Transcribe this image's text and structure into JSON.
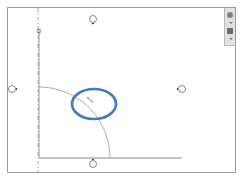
{
  "view": {
    "type": "drawing-canvas",
    "background": "#ffffff",
    "frame_color": "#9a9a9a"
  },
  "navigation_bar": {
    "buttons": [
      {
        "name": "steering-wheel",
        "icon": "steering-wheel-icon"
      },
      {
        "name": "zoom",
        "icon": "zoom-icon"
      }
    ]
  },
  "drawing": {
    "elevation_markers": [
      {
        "position": "top",
        "x": 93,
        "y": 19
      },
      {
        "position": "left",
        "x": 12,
        "y": 89
      },
      {
        "position": "right",
        "x": 182,
        "y": 89
      },
      {
        "position": "bottom",
        "x": 93,
        "y": 163
      }
    ],
    "door_swing_arc": {
      "center_x": 38,
      "center_y": 158,
      "radius": 71
    },
    "angle_label": "90.00°",
    "highlight_color": "#3a7cc1"
  }
}
